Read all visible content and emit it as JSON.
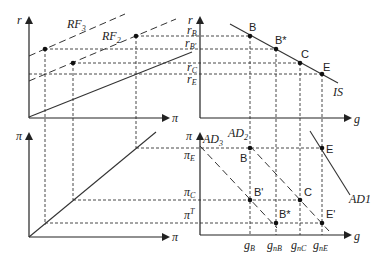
{
  "diagram": {
    "type": "four-quadrant macroeconomic diagram",
    "colors": {
      "line": "#222222",
      "background": "#ffffff"
    },
    "quadrants": {
      "top_left": {
        "y_axis": "r",
        "x_axis": "π",
        "curves": [
          {
            "label_main": "RF",
            "label_sub": "3",
            "style": "dashed"
          },
          {
            "label_main": "RF",
            "label_sub": "2",
            "style": "dashed"
          },
          {
            "label_main": "",
            "label_sub": "",
            "style": "solid"
          }
        ]
      },
      "top_right": {
        "y_axis": "r",
        "x_axis": "g",
        "y_ticks": [
          {
            "main": "r",
            "sub": "B"
          },
          {
            "main": "r",
            "sub": "B'"
          },
          {
            "main": "r",
            "sub": "C"
          },
          {
            "main": "r",
            "sub": "E"
          }
        ],
        "curve_label": "IS",
        "points": [
          "B",
          "B*",
          "C",
          "E"
        ]
      },
      "bottom_left": {
        "y_axis": "π",
        "x_axis": "π",
        "curve": "45-degree line"
      },
      "bottom_right": {
        "y_axis": "π",
        "x_axis": "g",
        "y_ticks": [
          {
            "main": "π",
            "sub": "E",
            "sup": ""
          },
          {
            "main": "π",
            "sub": "C",
            "sup": ""
          },
          {
            "main": "π",
            "sub": "",
            "sup": "T"
          }
        ],
        "x_ticks": [
          {
            "main": "g",
            "sub": "B"
          },
          {
            "main": "g",
            "sub": "nB"
          },
          {
            "main": "g",
            "sub": "nC"
          },
          {
            "main": "g",
            "sub": "nE"
          }
        ],
        "curves": [
          {
            "label_main": "AD",
            "label_sub": "3",
            "style": "dashed"
          },
          {
            "label_main": "AD",
            "label_sub": "2",
            "style": "dashed"
          },
          {
            "label_main": "AD",
            "label_sub": "1",
            "style": "solid"
          }
        ],
        "points": [
          "E",
          "B",
          "B'",
          "C",
          "B*",
          "E'"
        ]
      }
    }
  }
}
